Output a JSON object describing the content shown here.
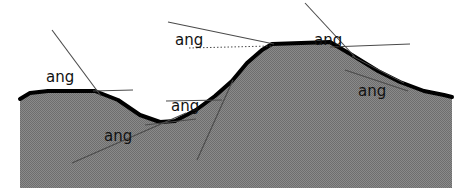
{
  "figure": {
    "background_color": "#ffffff",
    "terrain_fill_color": "#808080",
    "terrain_outline_color": "#000000",
    "annotation_line_color": "#4a4a4a",
    "label_text_color": "#111111",
    "width": 472,
    "height": 196
  },
  "terrain": {
    "name": "ground-profile",
    "description": "Shaded landform cross-section: left plateau, valley, central high ridge, right descending slope",
    "outline_path": "M 20,188 L 20,99 L 30,93 L 48,91 L 95,91 L 118,100 L 140,115 L 160,122 L 175,121 L 196,110 L 215,96 L 232,81 L 247,63 L 262,50 L 272,44 L 330,42 L 352,55 L 378,71 L 400,82 L 424,91 L 444,95 L 452,97 L 452,188 Z",
    "surface_path": "M 20,99 L 30,93 L 48,91 L 95,91 L 118,100 L 140,115 L 160,122 L 175,121 L 196,110 L 215,96 L 232,81 L 247,63 L 262,50 L 272,44 L 330,42 L 352,55 L 378,71 L 400,82 L 424,91 L 444,95 L 452,97"
  },
  "annotations": {
    "label_text": "ang",
    "items": [
      {
        "id": "angle-left-plateau",
        "label": "ang",
        "label_x": 46,
        "label_y": 82,
        "vertex_x": 97,
        "vertex_y": 92,
        "inclined_line": {
          "x1": 52,
          "y1": 30,
          "x2": 101,
          "y2": 96
        },
        "reference_line": {
          "x1": 93,
          "y1": 91,
          "x2": 133,
          "y2": 90
        },
        "reference_style": "solid"
      },
      {
        "id": "angle-valley-bottom",
        "label": "ang",
        "label_x": 104,
        "label_y": 141,
        "vertex_x": 166,
        "vertex_y": 122,
        "inclined_line": {
          "x1": 72,
          "y1": 163,
          "x2": 186,
          "y2": 113
        },
        "reference_line": {
          "x1": 145,
          "y1": 125,
          "x2": 196,
          "y2": 119
        },
        "reference_style": "solid"
      },
      {
        "id": "angle-valley-right-flank",
        "label": "ang",
        "label_x": 171,
        "label_y": 111,
        "vertex_x": 215,
        "vertex_y": 96,
        "inclined_line": {
          "x1": 197,
          "y1": 160,
          "x2": 233,
          "y2": 80
        },
        "reference_line": {
          "x1": 166,
          "y1": 101,
          "x2": 222,
          "y2": 100
        },
        "reference_style": "solid"
      },
      {
        "id": "angle-ridge-left-shoulder",
        "label": "ang",
        "label_x": 175,
        "label_y": 45,
        "vertex_x": 272,
        "vertex_y": 44,
        "inclined_line": {
          "x1": 168,
          "y1": 22,
          "x2": 274,
          "y2": 44
        },
        "reference_line": {
          "x1": 189,
          "y1": 48,
          "x2": 271,
          "y2": 46
        },
        "reference_style": "dotted"
      },
      {
        "id": "angle-ridge-right-shoulder",
        "label": "ang",
        "label_x": 314,
        "label_y": 45,
        "vertex_x": 333,
        "vertex_y": 43,
        "inclined_line": {
          "x1": 305,
          "y1": 3,
          "x2": 355,
          "y2": 57
        },
        "reference_line": {
          "x1": 330,
          "y1": 47,
          "x2": 410,
          "y2": 44
        },
        "reference_style": "solid"
      },
      {
        "id": "angle-right-slope",
        "label": "ang",
        "label_x": 358,
        "label_y": 96,
        "vertex_x": 400,
        "vertex_y": 82,
        "inclined_line": {
          "x1": 345,
          "y1": 70,
          "x2": 408,
          "y2": 91
        },
        "reference_line": {
          "x1": 352,
          "y1": 56,
          "x2": 404,
          "y2": 83
        },
        "reference_style": "solid"
      }
    ]
  }
}
